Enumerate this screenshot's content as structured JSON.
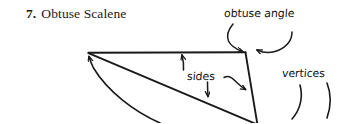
{
  "figure": {
    "item_number": "7.",
    "title": "Obtuse Scalene",
    "shape": "obtuse scalene triangle",
    "ink_color": "#1a1a1a",
    "background_color": "#ffffff"
  },
  "annotations": {
    "obtuse_angle": "obtuse angle",
    "sides": "sides",
    "vertices": "vertices"
  },
  "icons": {
    "arrow_to_obtuse_vertex_left": "curved-arrow-down-icon",
    "arrow_to_obtuse_vertex_right": "curved-arrow-down-left-icon",
    "arrow_sides_up": "arrow-up-icon",
    "arrow_sides_down": "arrow-down-icon",
    "arrow_sides_right": "arrow-right-icon",
    "arrow_sides_sweep": "curved-arrow-up-left-icon",
    "arc_vertex_bottom": "arc-pointer-icon",
    "arc_vertex_right": "arc-pointer-icon"
  }
}
